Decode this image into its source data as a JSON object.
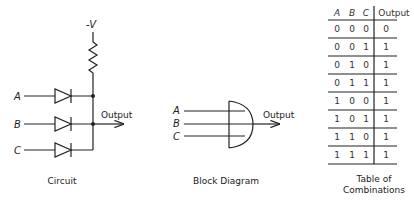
{
  "circuit": {
    "supply_label": "-V",
    "inputs": [
      "A",
      "B",
      "C"
    ],
    "output_label": "Output",
    "caption": "Circuit"
  },
  "block_diagram": {
    "inputs": [
      "A",
      "B",
      "C"
    ],
    "output_label": "Output",
    "caption": "Block Diagram"
  },
  "truth_table": {
    "headers": [
      "A",
      "B",
      "C",
      "Output"
    ],
    "rows": [
      [
        "0",
        "0",
        "0",
        "0"
      ],
      [
        "0",
        "0",
        "1",
        "1"
      ],
      [
        "0",
        "1",
        "0",
        "1"
      ],
      [
        "0",
        "1",
        "1",
        "1"
      ],
      [
        "1",
        "0",
        "0",
        "1"
      ],
      [
        "1",
        "0",
        "1",
        "1"
      ],
      [
        "1",
        "1",
        "0",
        "1"
      ],
      [
        "1",
        "1",
        "1",
        "1"
      ]
    ],
    "caption_line1": "Table of",
    "caption_line2": "Combinations"
  }
}
